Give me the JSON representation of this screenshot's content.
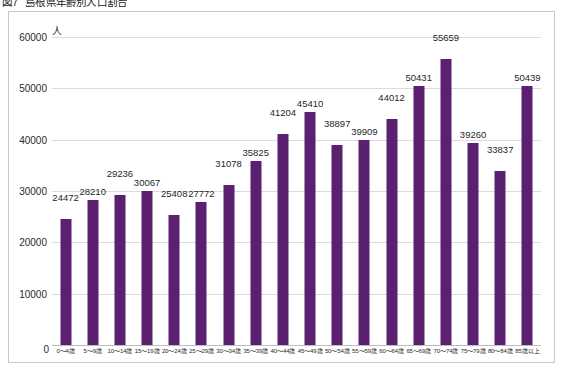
{
  "figure": {
    "caption_number": "図7",
    "caption_title": "島根県年齢別人口割合"
  },
  "axis": {
    "y_unit": "人",
    "zero_label": "0"
  },
  "chart_data": {
    "type": "bar",
    "xlabel": "",
    "ylabel": "人",
    "ylim": [
      0,
      60000
    ],
    "yticks": [
      0,
      10000,
      20000,
      30000,
      40000,
      50000,
      60000
    ],
    "ytick_labels": [
      "0",
      "10000",
      "20000",
      "30000",
      "40000",
      "50000",
      "60000"
    ],
    "grid": true,
    "legend": false,
    "bar_color": "#5B2070",
    "categories": [
      "0〜4歳",
      "5〜9歳",
      "10〜14歳",
      "15〜19歳",
      "20〜24歳",
      "25〜29歳",
      "30〜34歳",
      "35〜39歳",
      "40〜44歳",
      "45〜49歳",
      "50〜54歳",
      "55〜59歳",
      "60〜64歳",
      "65〜69歳",
      "70〜74歳",
      "75〜79歳",
      "80〜84歳",
      "85歳以上"
    ],
    "values": [
      24472,
      28210,
      29236,
      30067,
      25408,
      27772,
      31078,
      35825,
      41204,
      45410,
      38897,
      39909,
      44012,
      50431,
      55659,
      39260,
      33837,
      50439
    ],
    "value_labels": [
      "24472",
      "28210",
      "29236",
      "30067",
      "25408",
      "27772",
      "31078",
      "35825",
      "41204",
      "45410",
      "38897",
      "39909",
      "44012",
      "50431",
      "55659",
      "39260",
      "33837",
      "50439"
    ]
  }
}
